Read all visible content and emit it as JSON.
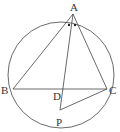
{
  "diagram": {
    "circle": {
      "cx": 61,
      "cy": 75,
      "r": 53
    },
    "points": {
      "A": {
        "label": "A",
        "x": 73,
        "y": 14,
        "lx": 70,
        "ly": 11
      },
      "B": {
        "label": "B",
        "x": 13,
        "y": 89,
        "lx": 1,
        "ly": 94
      },
      "C": {
        "label": "C",
        "x": 107,
        "y": 89,
        "lx": 109,
        "ly": 94
      },
      "D": {
        "label": "D",
        "x": 64,
        "y": 89,
        "lx": 53,
        "ly": 100
      },
      "P": {
        "label": "P",
        "x": 60,
        "y": 110,
        "lx": 56,
        "ly": 126
      }
    },
    "segments": [
      [
        "A",
        "B"
      ],
      [
        "A",
        "C"
      ],
      [
        "B",
        "C"
      ],
      [
        "A",
        "P"
      ],
      [
        "P",
        "C"
      ]
    ],
    "angle_marks": "equal angles BAD and DAC marked with dots",
    "colors": {
      "stroke": "#444444",
      "text": "#333333"
    }
  }
}
